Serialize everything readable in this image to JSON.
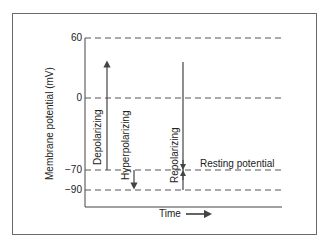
{
  "diagram": {
    "y_axis_label": "Membrane potential (mV)",
    "x_axis_label": "Time",
    "y_ticks": [
      {
        "label": "60",
        "value": 60
      },
      {
        "label": "0",
        "value": 0
      },
      {
        "label": "−70",
        "value": -70
      },
      {
        "label": "−90",
        "value": -90
      }
    ],
    "phases": [
      {
        "label": "Depolarizing",
        "from_mV": -70,
        "to_mV": 40,
        "direction": "up"
      },
      {
        "label": "Hyperpolarizing",
        "from_mV": -70,
        "to_mV": -90,
        "direction": "down"
      },
      {
        "label": "Repolarizing",
        "from_mV": 40,
        "to_mV": -70,
        "direction": "down"
      }
    ],
    "annotations": {
      "resting_potential": "Resting potential"
    },
    "colors": {
      "line": "#444444",
      "dash": "#555555",
      "frame": "#6a6a6a"
    }
  }
}
